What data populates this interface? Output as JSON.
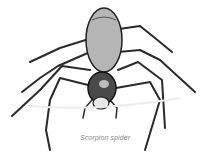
{
  "figure": {
    "caption": "Scorpion spider"
  }
}
